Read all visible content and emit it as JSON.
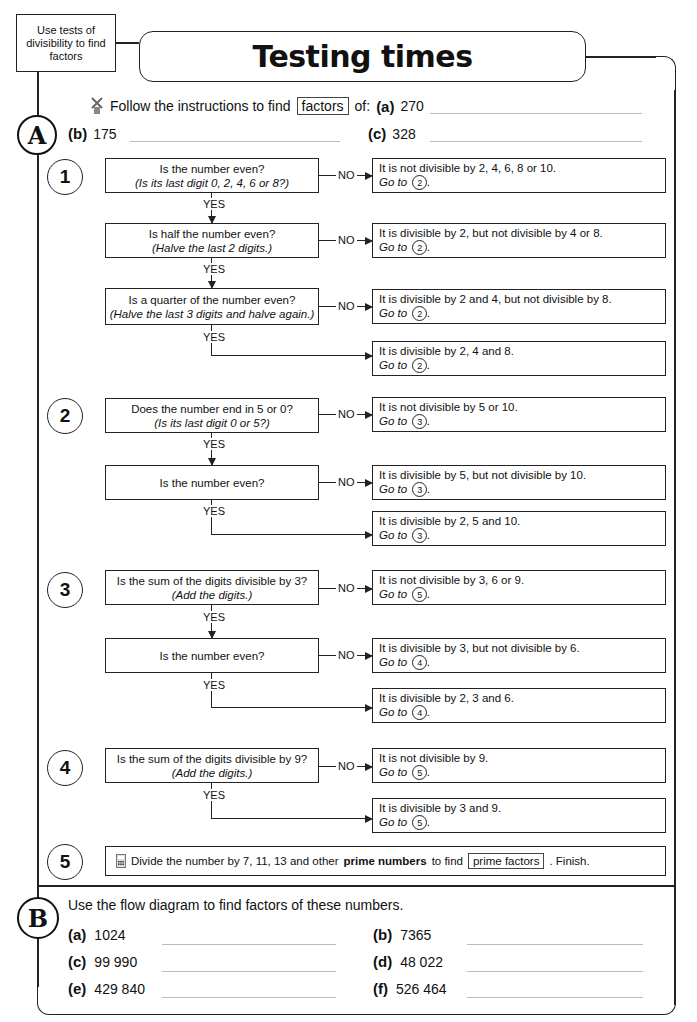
{
  "header": {
    "objective": "Use tests of divisibility to find factors",
    "title": "Testing times"
  },
  "section_a": {
    "letter": "A",
    "intro_text": "Follow the instructions to find",
    "keyword": "factors",
    "of": "of:",
    "items": [
      {
        "label": "(a)",
        "value": "270"
      },
      {
        "label": "(b)",
        "value": "175"
      },
      {
        "label": "(c)",
        "value": "328"
      }
    ]
  },
  "flow": {
    "no": "NO",
    "yes": "YES",
    "goto": "Go to",
    "steps": [
      {
        "num": "1",
        "questions": [
          {
            "q": "Is the number even?",
            "hint": "(Is its last digit 0, 2, 4, 6 or 8?)"
          },
          {
            "q": "Is half the number even?",
            "hint": "(Halve the last 2 digits.)"
          },
          {
            "q": "Is a quarter of the number even?",
            "hint": "(Halve the last 3 digits and halve again.)"
          }
        ],
        "results": [
          {
            "text": "It is not divisible by 2, 4, 6, 8 or 10.",
            "goto": "2"
          },
          {
            "text": "It is divisible by 2, but not divisible by 4 or 8.",
            "goto": "2"
          },
          {
            "text": "It is divisible by 2 and 4, but not divisible by 8.",
            "goto": "2"
          },
          {
            "text": "It is divisible by 2, 4 and 8.",
            "goto": "2"
          }
        ]
      },
      {
        "num": "2",
        "questions": [
          {
            "q": "Does the number end in 5 or 0?",
            "hint": "(Is its last digit 0 or 5?)"
          },
          {
            "q": "Is the number even?",
            "hint": ""
          }
        ],
        "results": [
          {
            "text": "It is not divisible by 5 or 10.",
            "goto": "3"
          },
          {
            "text": "It is divisible by 5, but not divisible by 10.",
            "goto": "3"
          },
          {
            "text": "It is divisible by 2, 5 and 10.",
            "goto": "3"
          }
        ]
      },
      {
        "num": "3",
        "questions": [
          {
            "q": "Is the sum of the digits divisible by 3?",
            "hint": "(Add the digits.)"
          },
          {
            "q": "Is the number even?",
            "hint": ""
          }
        ],
        "results": [
          {
            "text": "It is not divisible by 3, 6 or 9.",
            "goto": "5"
          },
          {
            "text": "It is divisible by 3, but not divisible by 6.",
            "goto": "4"
          },
          {
            "text": "It is divisible by 2, 3 and 6.",
            "goto": "4"
          }
        ]
      },
      {
        "num": "4",
        "questions": [
          {
            "q": "Is the sum of the digits divisible by 9?",
            "hint": "(Add the digits.)"
          }
        ],
        "results": [
          {
            "text": "It is not divisible by 9.",
            "goto": "5"
          },
          {
            "text": "It is divisible by 3 and 9.",
            "goto": "5"
          }
        ]
      },
      {
        "num": "5",
        "text_before": "Divide the number by 7, 11, 13 and other",
        "bold": "prime numbers",
        "text_mid": "to find",
        "keyword": "prime factors",
        "text_after": ". Finish."
      }
    ]
  },
  "section_b": {
    "letter": "B",
    "instruction": "Use the flow diagram to find factors of these numbers.",
    "items": [
      {
        "label": "(a)",
        "value": "1024"
      },
      {
        "label": "(b)",
        "value": "7365"
      },
      {
        "label": "(c)",
        "value": "99 990"
      },
      {
        "label": "(d)",
        "value": "48 022"
      },
      {
        "label": "(e)",
        "value": "429 840"
      },
      {
        "label": "(f)",
        "value": "526 464"
      }
    ]
  },
  "icons": {
    "windmill": "windmill-icon",
    "calculator": "calculator-icon"
  }
}
